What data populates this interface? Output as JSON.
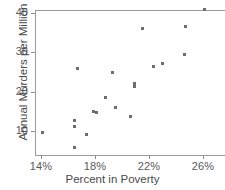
{
  "chart_data": {
    "type": "scatter",
    "title": "",
    "xlabel": "Percent in Poverty",
    "ylabel": "Annual Murders per Million",
    "xlim": [
      13.2,
      27.2
    ],
    "ylim": [
      4.0,
      41.8
    ],
    "xticks": [
      14,
      18,
      22,
      26
    ],
    "xticklabels": [
      "14%",
      "18%",
      "22%",
      "26%"
    ],
    "yticks": [
      10,
      20,
      30,
      40
    ],
    "yticklabels": [
      "10",
      "20",
      "30",
      "40"
    ],
    "grid": false,
    "legend": null,
    "marker": "square",
    "marker_color": "#6e6e70",
    "points": [
      {
        "x": 14.1,
        "y": 9.6
      },
      {
        "x": 16.5,
        "y": 5.7
      },
      {
        "x": 16.5,
        "y": 11.2
      },
      {
        "x": 16.5,
        "y": 12.7
      },
      {
        "x": 16.7,
        "y": 25.9
      },
      {
        "x": 17.4,
        "y": 9.0
      },
      {
        "x": 17.9,
        "y": 14.9
      },
      {
        "x": 18.1,
        "y": 14.8
      },
      {
        "x": 18.8,
        "y": 18.4
      },
      {
        "x": 19.3,
        "y": 25.0
      },
      {
        "x": 19.5,
        "y": 16.0
      },
      {
        "x": 20.6,
        "y": 13.7
      },
      {
        "x": 20.9,
        "y": 21.3
      },
      {
        "x": 20.9,
        "y": 22.0
      },
      {
        "x": 21.5,
        "y": 36.0
      },
      {
        "x": 22.3,
        "y": 26.4
      },
      {
        "x": 23.0,
        "y": 27.2
      },
      {
        "x": 24.6,
        "y": 29.4
      },
      {
        "x": 24.7,
        "y": 36.6
      },
      {
        "x": 26.1,
        "y": 41.0
      }
    ]
  },
  "axis": {
    "x_title": "Percent in Poverty",
    "y_title": "Annual Murders per Million"
  },
  "colors": {
    "marker": "#6e6e70",
    "axis": "#9a9a9a",
    "tick": "#8d8d8d",
    "label": "#58595b",
    "title": "#4a4a4c",
    "background": "#ffffff"
  }
}
